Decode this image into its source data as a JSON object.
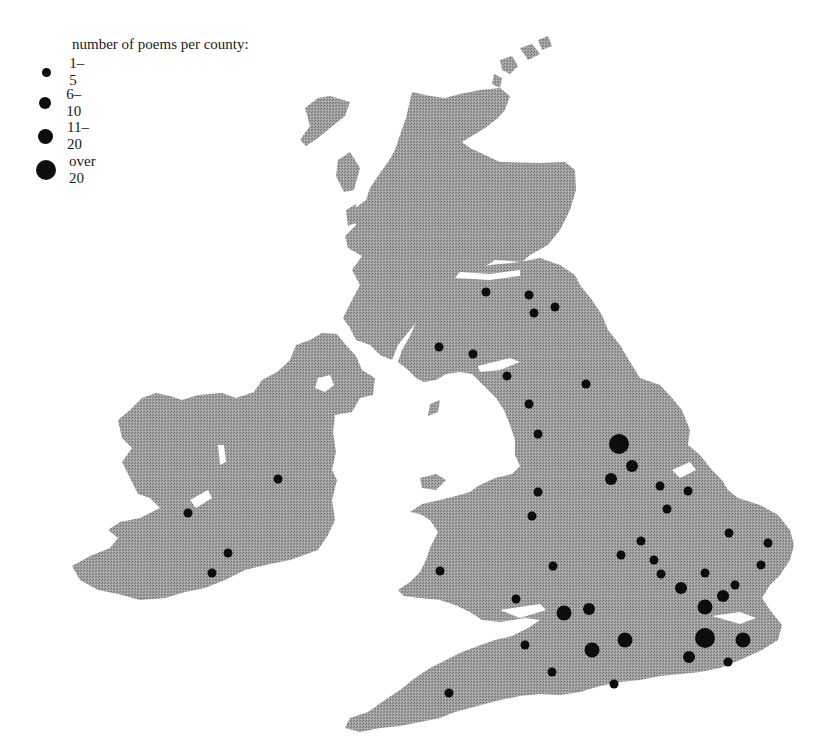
{
  "legend": {
    "title": "number of poems per county:",
    "items": [
      {
        "label": "1–5",
        "size": "small",
        "radius": 4.5
      },
      {
        "label": "6–10",
        "size": "medium",
        "radius": 6
      },
      {
        "label": "11–20",
        "size": "large",
        "radius": 7.5
      },
      {
        "label": "over 20",
        "size": "xlarge",
        "radius": 10
      }
    ]
  },
  "colors": {
    "land": "#9a9a9a",
    "land_dark": "#7c7c7c",
    "dot": "#0d0d0d",
    "background": "#ffffff"
  },
  "chart_data": {
    "type": "scatter",
    "title": "number of poems per county",
    "legend_position": "top-left",
    "size_classes": [
      "1–5",
      "6–10",
      "11–20",
      "over 20"
    ],
    "points": [
      {
        "region": "Ireland",
        "x": 278,
        "y": 479,
        "class": "1–5"
      },
      {
        "region": "Ireland",
        "x": 188,
        "y": 513,
        "class": "1–5"
      },
      {
        "region": "Ireland",
        "x": 228,
        "y": 553,
        "class": "1–5"
      },
      {
        "region": "Ireland",
        "x": 212,
        "y": 573,
        "class": "1–5"
      },
      {
        "region": "Scotland",
        "x": 486,
        "y": 292,
        "class": "1–5"
      },
      {
        "region": "Scotland",
        "x": 529,
        "y": 295,
        "class": "1–5"
      },
      {
        "region": "Scotland",
        "x": 534,
        "y": 313,
        "class": "1–5"
      },
      {
        "region": "Scotland",
        "x": 555,
        "y": 307,
        "class": "1–5"
      },
      {
        "region": "Scotland",
        "x": 439,
        "y": 347,
        "class": "1–5"
      },
      {
        "region": "Scotland",
        "x": 473,
        "y": 354,
        "class": "1–5"
      },
      {
        "region": "England",
        "x": 507,
        "y": 376,
        "class": "1–5"
      },
      {
        "region": "England",
        "x": 586,
        "y": 384,
        "class": "1–5"
      },
      {
        "region": "England",
        "x": 529,
        "y": 404,
        "class": "1–5"
      },
      {
        "region": "England",
        "x": 538,
        "y": 434,
        "class": "1–5"
      },
      {
        "region": "England",
        "x": 619,
        "y": 444,
        "class": "over 20"
      },
      {
        "region": "England",
        "x": 632,
        "y": 466,
        "class": "6–10"
      },
      {
        "region": "England",
        "x": 611,
        "y": 479,
        "class": "6–10"
      },
      {
        "region": "England",
        "x": 660,
        "y": 486,
        "class": "1–5"
      },
      {
        "region": "England",
        "x": 688,
        "y": 491,
        "class": "1–5"
      },
      {
        "region": "Wales",
        "x": 538,
        "y": 492,
        "class": "1–5"
      },
      {
        "region": "Wales",
        "x": 532,
        "y": 516,
        "class": "1–5"
      },
      {
        "region": "England",
        "x": 667,
        "y": 509,
        "class": "1–5"
      },
      {
        "region": "England",
        "x": 729,
        "y": 533,
        "class": "1–5"
      },
      {
        "region": "England",
        "x": 768,
        "y": 543,
        "class": "1–5"
      },
      {
        "region": "England",
        "x": 641,
        "y": 541,
        "class": "1–5"
      },
      {
        "region": "England",
        "x": 621,
        "y": 555,
        "class": "1–5"
      },
      {
        "region": "England",
        "x": 654,
        "y": 560,
        "class": "1–5"
      },
      {
        "region": "Wales",
        "x": 553,
        "y": 566,
        "class": "1–5"
      },
      {
        "region": "England",
        "x": 761,
        "y": 565,
        "class": "1–5"
      },
      {
        "region": "Wales",
        "x": 440,
        "y": 571,
        "class": "1–5"
      },
      {
        "region": "England",
        "x": 661,
        "y": 574,
        "class": "1–5"
      },
      {
        "region": "England",
        "x": 705,
        "y": 573,
        "class": "1–5"
      },
      {
        "region": "England",
        "x": 735,
        "y": 585,
        "class": "1–5"
      },
      {
        "region": "England",
        "x": 681,
        "y": 588,
        "class": "6–10"
      },
      {
        "region": "England",
        "x": 723,
        "y": 596,
        "class": "6–10"
      },
      {
        "region": "Wales",
        "x": 516,
        "y": 599,
        "class": "1–5"
      },
      {
        "region": "England",
        "x": 705,
        "y": 607,
        "class": "11–20"
      },
      {
        "region": "England",
        "x": 564,
        "y": 613,
        "class": "11–20"
      },
      {
        "region": "England",
        "x": 589,
        "y": 609,
        "class": "6–10"
      },
      {
        "region": "England",
        "x": 625,
        "y": 640,
        "class": "11–20"
      },
      {
        "region": "England",
        "x": 592,
        "y": 650,
        "class": "11–20"
      },
      {
        "region": "England",
        "x": 705,
        "y": 638,
        "class": "over 20"
      },
      {
        "region": "England",
        "x": 743,
        "y": 640,
        "class": "11–20"
      },
      {
        "region": "England",
        "x": 525,
        "y": 645,
        "class": "1–5"
      },
      {
        "region": "England",
        "x": 689,
        "y": 657,
        "class": "6–10"
      },
      {
        "region": "England",
        "x": 728,
        "y": 662,
        "class": "1–5"
      },
      {
        "region": "England",
        "x": 552,
        "y": 672,
        "class": "1–5"
      },
      {
        "region": "England",
        "x": 614,
        "y": 684,
        "class": "1–5"
      },
      {
        "region": "England",
        "x": 449,
        "y": 693,
        "class": "1–5"
      }
    ]
  }
}
